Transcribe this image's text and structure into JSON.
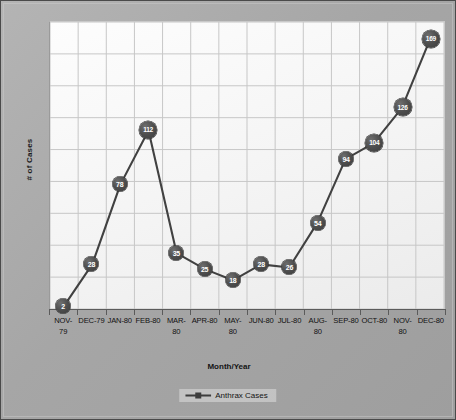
{
  "chart_data": {
    "type": "line",
    "title": "",
    "xlabel": "Month/Year",
    "ylabel": "# of Cases",
    "grid": true,
    "legend_position": "bottom-center",
    "categories": [
      "NOV-79",
      "DEC-79",
      "JAN-80",
      "FEB-80",
      "MAR-80",
      "APR-80",
      "MAY-80",
      "JUN-80",
      "JUL-80",
      "AUG-80",
      "SEP-80",
      "OCT-80",
      "NOV-80",
      "DEC-80"
    ],
    "tick_labels": [
      {
        "line1": "NOV-",
        "line2": "79"
      },
      {
        "line1": "DEC-79",
        "line2": ""
      },
      {
        "line1": "JAN-80",
        "line2": ""
      },
      {
        "line1": "FEB-80",
        "line2": ""
      },
      {
        "line1": "MAR-",
        "line2": "80"
      },
      {
        "line1": "APR-80",
        "line2": ""
      },
      {
        "line1": "MAY-",
        "line2": "80"
      },
      {
        "line1": "JUN-80",
        "line2": ""
      },
      {
        "line1": "JUL-80",
        "line2": ""
      },
      {
        "line1": "AUG-",
        "line2": "80"
      },
      {
        "line1": "SEP-80",
        "line2": ""
      },
      {
        "line1": "OCT-80",
        "line2": ""
      },
      {
        "line1": "NOV-",
        "line2": "80"
      },
      {
        "line1": "DEC-80",
        "line2": ""
      }
    ],
    "series": [
      {
        "name": "Anthrax Cases",
        "values": [
          2,
          28,
          78,
          112,
          35,
          25,
          18,
          28,
          26,
          54,
          94,
          104,
          126,
          169
        ],
        "color": "#414141",
        "marker": "circle-with-label"
      }
    ],
    "ylim": [
      0,
      180
    ],
    "y_gridline_step": 20,
    "show_y_tick_labels": false
  },
  "legend": {
    "entries": [
      {
        "label": "Anthrax Cases"
      }
    ]
  },
  "colors": {
    "frame_background": "#a9a9a9",
    "plot_background": "#fbfbfb",
    "gridline": "#c7c7c7",
    "series_line": "#414141",
    "marker_fill": "#4a4a4a",
    "marker_text": "#ffffff",
    "axis_line": "#5b5b5b",
    "text": "#141414"
  }
}
